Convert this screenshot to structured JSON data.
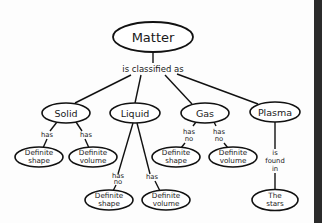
{
  "diagram": {
    "type": "concept-map",
    "root": {
      "id": "matter",
      "label": "Matter",
      "cx": 153,
      "cy": 37,
      "rx": 40,
      "ry": 15
    },
    "root_link": {
      "label": "is classified as",
      "x": 153,
      "y": 72
    },
    "states": [
      {
        "id": "solid",
        "label": "Solid",
        "cx": 66,
        "cy": 113,
        "rx": 24,
        "ry": 10
      },
      {
        "id": "liquid",
        "label": "Liquid",
        "cx": 135,
        "cy": 113,
        "rx": 25,
        "ry": 10
      },
      {
        "id": "gas",
        "label": "Gas",
        "cx": 205,
        "cy": 113,
        "rx": 24,
        "ry": 10
      },
      {
        "id": "plasma",
        "label": "Plasma",
        "cx": 275,
        "cy": 112,
        "rx": 25,
        "ry": 10
      }
    ],
    "properties": [
      {
        "id": "solid-shape",
        "parent": "solid",
        "line1": "Definite",
        "line2": "shape",
        "cx": 39,
        "cy": 157,
        "link1": "has",
        "link2": ""
      },
      {
        "id": "solid-volume",
        "parent": "solid",
        "line1": "Definite",
        "line2": "volume",
        "cx": 93,
        "cy": 157,
        "link1": "has",
        "link2": ""
      },
      {
        "id": "liquid-shape",
        "parent": "liquid",
        "line1": "Definite",
        "line2": "shape",
        "cx": 109,
        "cy": 200,
        "link1": "has",
        "link2": "no"
      },
      {
        "id": "liquid-volume",
        "parent": "liquid",
        "line1": "Definite",
        "line2": "volume",
        "cx": 166,
        "cy": 200,
        "link1": "has",
        "link2": ""
      },
      {
        "id": "gas-shape",
        "parent": "gas",
        "line1": "Definite",
        "line2": "shape",
        "cx": 176,
        "cy": 157,
        "link1": "has",
        "link2": "no"
      },
      {
        "id": "gas-volume",
        "parent": "gas",
        "line1": "Definite",
        "line2": "volume",
        "cx": 233,
        "cy": 157,
        "link1": "has",
        "link2": "no"
      },
      {
        "id": "plasma-stars",
        "parent": "plasma",
        "line1": "The",
        "line2": "stars",
        "cx": 275,
        "cy": 200,
        "link1": "is",
        "link2": "found",
        "link3": "in"
      }
    ],
    "colors": {
      "stroke": "#111111",
      "fill": "#ffffff",
      "background": "#fdfdfd",
      "edge_bar": "#2b2b2b"
    }
  }
}
